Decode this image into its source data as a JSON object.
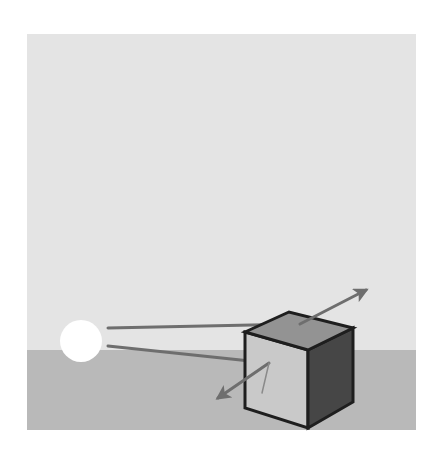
{
  "figure": {
    "colors": {
      "page": "#ffffff",
      "sky": "#e4e4e4",
      "ground": "#b9b9b9",
      "light": "#ffffff",
      "cube_top": "#939393",
      "cube_front": "#c9c9c9",
      "cube_side": "#464646",
      "cube_edge": "#1e1e1e",
      "ray": "#6e6e6e",
      "ray_faint": "#8a8a8a"
    },
    "frame": {
      "x": 27,
      "y": 34,
      "width": 389,
      "height": 396
    },
    "horizon_y": 350,
    "light_source": {
      "cx": 81,
      "cy": 341,
      "r": 21
    },
    "cube": {
      "top_face": [
        [
          245,
          332
        ],
        [
          289,
          312
        ],
        [
          353,
          328
        ],
        [
          308,
          350
        ]
      ],
      "front_face": [
        [
          245,
          332
        ],
        [
          308,
          350
        ],
        [
          308,
          428
        ],
        [
          245,
          408
        ]
      ],
      "side_face": [
        [
          308,
          350
        ],
        [
          353,
          328
        ],
        [
          353,
          402
        ],
        [
          308,
          428
        ]
      ]
    },
    "rays": [
      {
        "name": "incident-ray-top",
        "from": [
          108,
          328
        ],
        "to": [
          300,
          324
        ]
      },
      {
        "name": "reflected-ray-top",
        "from": [
          300,
          324
        ],
        "to": [
          366,
          290
        ],
        "arrow": true
      },
      {
        "name": "incident-ray-front",
        "from": [
          108,
          346
        ],
        "to": [
          269,
          363
        ]
      },
      {
        "name": "reflected-ray-front",
        "from": [
          269,
          363
        ],
        "to": [
          218,
          398
        ],
        "arrow": true
      },
      {
        "name": "transmitted-ray-front",
        "from": [
          269,
          363
        ],
        "to": [
          262,
          393
        ],
        "arrow": false,
        "faint": true
      }
    ]
  }
}
